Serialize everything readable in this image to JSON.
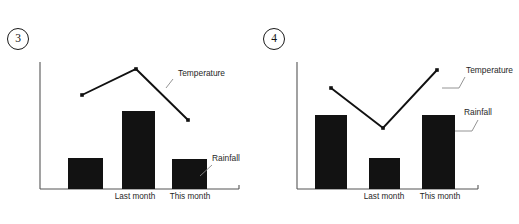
{
  "figure": {
    "background_color": "#ffffff",
    "ink_color": "#121212",
    "leader_color": "#888888",
    "axis_color": "#555555"
  },
  "panels": [
    {
      "id": "panel-3",
      "number_label": "3",
      "chart_data": {
        "type": "bar",
        "title": "",
        "xlabel": "",
        "ylabel": "",
        "grid": false,
        "legend_position": "callout-annotations",
        "categories": [
          "",
          "Last month",
          "This month"
        ],
        "axis": {
          "x_start": 40,
          "x_end": 239,
          "baseline_y": 189,
          "y_top": 62
        },
        "series": [
          {
            "name": "Rainfall",
            "chart_type": "bar",
            "values": [
              31,
              78,
              30
            ],
            "bars": [
              {
                "x": 68,
                "width": 35,
                "top": 158
              },
              {
                "x": 122,
                "width": 33,
                "top": 111
              },
              {
                "x": 172,
                "width": 35,
                "top": 159
              }
            ]
          },
          {
            "name": "Temperature",
            "chart_type": "line",
            "values": [
              74,
              95,
              55
            ],
            "points": [
              {
                "x": 82,
                "y": 95
              },
              {
                "x": 136,
                "y": 69
              },
              {
                "x": 188,
                "y": 120
              }
            ],
            "shape": "rises to a peak at the middle, then falls"
          }
        ],
        "annotations": [
          {
            "name": "temperature-callout",
            "label": "Temperature",
            "label_x": 178,
            "label_y": 76,
            "leader": [
              [
                166,
                88
              ],
              [
                173,
                79
              ]
            ]
          },
          {
            "name": "rainfall-callout",
            "label": "Rainfall",
            "label_x": 212,
            "label_y": 161,
            "leader": [
              [
                200,
                176
              ],
              [
                212,
                165
              ]
            ]
          }
        ],
        "tick_labels": [
          {
            "text": "Last month",
            "x": 135,
            "y": 199
          },
          {
            "text": "This month",
            "x": 190,
            "y": 199
          }
        ]
      }
    },
    {
      "id": "panel-4",
      "number_label": "4",
      "chart_data": {
        "type": "bar",
        "title": "",
        "xlabel": "",
        "ylabel": "",
        "grid": false,
        "legend_position": "callout-annotations",
        "categories": [
          "",
          "Last month",
          "This month"
        ],
        "axis": {
          "x_start": 38,
          "x_end": 219,
          "baseline_y": 189,
          "y_top": 62
        },
        "series": [
          {
            "name": "Rainfall",
            "chart_type": "bar",
            "values": [
              58,
              24,
              58
            ],
            "bars": [
              {
                "x": 56,
                "width": 32,
                "top": 115
              },
              {
                "x": 110,
                "width": 31,
                "top": 158
              },
              {
                "x": 163,
                "width": 33,
                "top": 115
              }
            ]
          },
          {
            "name": "Temperature",
            "chart_type": "line",
            "values": [
              79,
              48,
              93
            ],
            "points": [
              {
                "x": 72,
                "y": 88
              },
              {
                "x": 124,
                "y": 128
              },
              {
                "x": 178,
                "y": 70
              }
            ],
            "shape": "falls to a low point at the middle, then rises"
          }
        ],
        "annotations": [
          {
            "name": "temperature-callout",
            "label": "Temperature",
            "label_x": 207,
            "label_y": 73,
            "leader": [
              [
                183,
                88
              ],
              [
                200,
                88
              ],
              [
                206,
                77
              ]
            ]
          },
          {
            "name": "rainfall-callout",
            "label": "Rainfall",
            "label_x": 205,
            "label_y": 115,
            "leader": [
              [
                196,
                131
              ],
              [
                213,
                131
              ],
              [
                219,
                120
              ]
            ]
          }
        ],
        "tick_labels": [
          {
            "text": "Last month",
            "x": 125,
            "y": 199
          },
          {
            "text": "This month",
            "x": 181,
            "y": 199
          }
        ]
      }
    }
  ]
}
